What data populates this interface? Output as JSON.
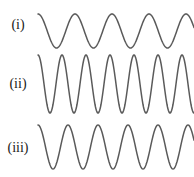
{
  "figure": {
    "background_color": "#ffffff",
    "stroke_color": "#5a5a5a",
    "stroke_width": 1.5,
    "width": 194,
    "height": 177
  },
  "rows": [
    {
      "label": "(i)",
      "label_y": 18,
      "wave_top": 6,
      "wave_height": 40,
      "amplitude_px": 17,
      "baseline_px": 25,
      "period_px": 37,
      "cycles": 3.5,
      "phase": "peak",
      "x_start": 2,
      "x_end": 158
    },
    {
      "label": "(ii)",
      "label_y": 77,
      "wave_top": 52,
      "wave_height": 64,
      "amplitude_px": 29,
      "baseline_px": 32,
      "period_px": 24,
      "cycles": 6.2,
      "phase": "peak",
      "x_start": 2,
      "x_end": 158
    },
    {
      "label": "(iii)",
      "label_y": 141,
      "wave_top": 121,
      "wave_height": 52,
      "amplitude_px": 22,
      "baseline_px": 26,
      "period_px": 30,
      "cycles": 5.0,
      "phase": "peak",
      "x_start": 2,
      "x_end": 158
    }
  ],
  "chart_data": {
    "type": "line",
    "xlabel": "",
    "ylabel": "",
    "grid": false,
    "legend": "none",
    "series": [
      {
        "name": "(i)",
        "waveform": "sine",
        "relative_amplitude": 17,
        "relative_period": 37,
        "cycles_shown": 3.5,
        "description": "lowest frequency, medium amplitude"
      },
      {
        "name": "(ii)",
        "waveform": "sine",
        "relative_amplitude": 29,
        "relative_period": 24,
        "cycles_shown": 6.2,
        "description": "highest frequency, largest amplitude"
      },
      {
        "name": "(iii)",
        "waveform": "sine",
        "relative_amplitude": 22,
        "relative_period": 30,
        "cycles_shown": 5.0,
        "description": "intermediate frequency and amplitude"
      }
    ]
  }
}
